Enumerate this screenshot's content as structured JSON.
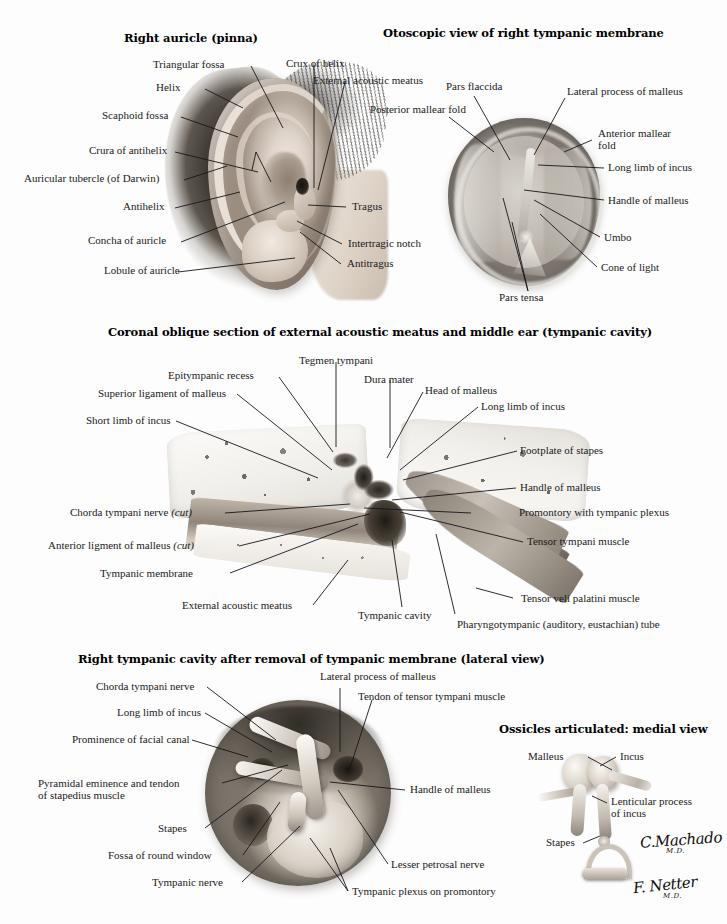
{
  "plate": {
    "title": "Ear: External, Middle and Inner Structures",
    "background_color": "#fdfdfd",
    "ink_color": "#16161a"
  },
  "panels": {
    "auricle": {
      "title": "Right auricle (pinna)",
      "labels": [
        {
          "text": "Triangular fossa"
        },
        {
          "text": "Crux of helix"
        },
        {
          "text": "Helix"
        },
        {
          "text": "External acoustic meatus"
        },
        {
          "text": "Scaphoid fossa"
        },
        {
          "text": "Crura of antihelix"
        },
        {
          "text": "Auricular tubercle (of Darwin)"
        },
        {
          "text": "Antihelix"
        },
        {
          "text": "Tragus"
        },
        {
          "text": "Concha of auricle"
        },
        {
          "text": "Intertragic notch"
        },
        {
          "text": "Antitragus"
        },
        {
          "text": "Lobule of auricle"
        }
      ]
    },
    "otoscopic": {
      "title": "Otoscopic view of right tympanic membrane",
      "labels": [
        {
          "text": "Pars flaccida"
        },
        {
          "text": "Posterior mallear fold"
        },
        {
          "text": "Lateral process of malleus"
        },
        {
          "text": "Anterior mallear fold"
        },
        {
          "text": "Long limb of incus"
        },
        {
          "text": "Handle of malleus"
        },
        {
          "text": "Umbo"
        },
        {
          "text": "Cone of light"
        },
        {
          "text": "Pars tensa"
        }
      ]
    },
    "coronal": {
      "title": "Coronal oblique section of external acoustic meatus and middle ear (tympanic cavity)",
      "labels": [
        {
          "text": "Tegmen tympani"
        },
        {
          "text": "Epitympanic recess"
        },
        {
          "text": "Dura mater"
        },
        {
          "text": "Head of malleus"
        },
        {
          "text": "Superior ligament of malleus"
        },
        {
          "text": "Long limb of incus"
        },
        {
          "text": "Short limb of incus"
        },
        {
          "text": "Footplate of stapes"
        },
        {
          "text": "Handle of malleus"
        },
        {
          "text": "Chorda tympani nerve ",
          "italic": "(cut)"
        },
        {
          "text": "Promontory with tympanic plexus"
        },
        {
          "text": "Anterior ligment of malleus ",
          "italic": "(cut)"
        },
        {
          "text": "Tensor tympani muscle"
        },
        {
          "text": "Tympanic membrane"
        },
        {
          "text": "External acoustic meatus"
        },
        {
          "text": "Tympanic cavity"
        },
        {
          "text": "Tensor veli palatini muscle"
        },
        {
          "text": "Pharyngotympanic (auditory, eustachian) tube"
        }
      ]
    },
    "tympanic_cavity": {
      "title": "Right tympanic cavity after removal of tympanic membrane (lateral view)",
      "labels": [
        {
          "text": "Chorda tympani nerve"
        },
        {
          "text": "Lateral process of malleus"
        },
        {
          "text": "Tendon of tensor tympani muscle"
        },
        {
          "text": "Long limb of incus"
        },
        {
          "text": "Prominence of facial canal"
        },
        {
          "text": "Pyramidal eminence and tendon"
        },
        {
          "text": "of stapedius muscle"
        },
        {
          "text": "Handle of malleus"
        },
        {
          "text": "Stapes"
        },
        {
          "text": "Fossa of round window"
        },
        {
          "text": "Lesser petrosal nerve"
        },
        {
          "text": "Tympanic nerve"
        },
        {
          "text": "Tympanic plexus on promontory"
        }
      ]
    },
    "ossicles": {
      "title": "Ossicles articulated: medial view",
      "labels": [
        {
          "text": "Malleus"
        },
        {
          "text": "Incus"
        },
        {
          "text": "Lenticular process"
        },
        {
          "text": "of incus"
        },
        {
          "text": "Stapes"
        }
      ]
    }
  },
  "signatures": [
    {
      "name": "C.Machado",
      "credential": "M.D."
    },
    {
      "name": "F. Netter",
      "credential": "M.D."
    }
  ]
}
